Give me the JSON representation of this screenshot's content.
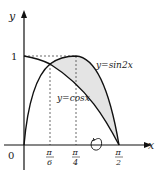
{
  "diagram": {
    "type": "function-graph",
    "axes": {
      "x_label": "x",
      "y_label": "y",
      "origin_label": "0"
    },
    "y_ticks": [
      {
        "label": "1",
        "value": 1
      }
    ],
    "x_ticks": [
      {
        "num": "π",
        "den": "6",
        "value": "pi/6"
      },
      {
        "num": "π",
        "den": "4",
        "value": "pi/4"
      },
      {
        "num": "π",
        "den": "2",
        "value": "pi/2"
      }
    ],
    "curves": [
      {
        "name": "sin2x",
        "label": "y=sin2x"
      },
      {
        "name": "cosx",
        "label": "y=cosx"
      }
    ],
    "shaded_region": "between y=sin2x and y=cosx from π/6 to π/2",
    "rotation_symbol": "rotation about x-axis",
    "colors": {
      "stroke": "#111111",
      "fill": "#e6e6e6",
      "dash": "#444444"
    }
  }
}
